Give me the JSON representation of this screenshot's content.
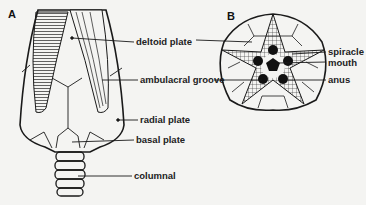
{
  "figure": {
    "panels": [
      {
        "letter": "A",
        "labels": [
          "deltoid plate",
          "ambulacral groove",
          "radial plate",
          "basal plate",
          "columnal"
        ]
      },
      {
        "letter": "B",
        "labels": [
          "spiracle",
          "mouth",
          "anus"
        ]
      }
    ]
  }
}
